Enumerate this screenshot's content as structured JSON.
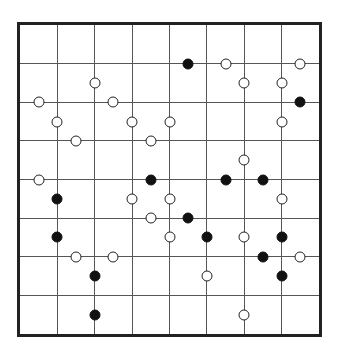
{
  "puzzle": {
    "type": "masyu-like pearl grid",
    "columns": 8,
    "rows": 8,
    "colors": {
      "border": "#222222",
      "grid_line": "#555555",
      "white_pearl": "#ffffff",
      "black_pearl": "#111111"
    },
    "pearls_note": "coordinates in half-cell units from top-left of board (cx, cy); even = on grid line, odd = cell middle",
    "pearls": [
      {
        "cx": 4,
        "cy": 3,
        "color": "white"
      },
      {
        "cx": 1,
        "cy": 4,
        "color": "white"
      },
      {
        "cx": 5,
        "cy": 4,
        "color": "white"
      },
      {
        "cx": 2,
        "cy": 5,
        "color": "white"
      },
      {
        "cx": 6,
        "cy": 5,
        "color": "white"
      },
      {
        "cx": 8,
        "cy": 5,
        "color": "white"
      },
      {
        "cx": 3,
        "cy": 6,
        "color": "white"
      },
      {
        "cx": 7,
        "cy": 6,
        "color": "white"
      },
      {
        "cx": 9,
        "cy": 2,
        "color": "black"
      },
      {
        "cx": 11,
        "cy": 2,
        "color": "white"
      },
      {
        "cx": 15,
        "cy": 2,
        "color": "white"
      },
      {
        "cx": 12,
        "cy": 3,
        "color": "white"
      },
      {
        "cx": 14,
        "cy": 3,
        "color": "white"
      },
      {
        "cx": 15,
        "cy": 4,
        "color": "black"
      },
      {
        "cx": 14,
        "cy": 5,
        "color": "white"
      },
      {
        "cx": 1,
        "cy": 8,
        "color": "white"
      },
      {
        "cx": 7,
        "cy": 8,
        "color": "black"
      },
      {
        "cx": 2,
        "cy": 9,
        "color": "black"
      },
      {
        "cx": 6,
        "cy": 9,
        "color": "white"
      },
      {
        "cx": 8,
        "cy": 9,
        "color": "white"
      },
      {
        "cx": 7,
        "cy": 10,
        "color": "white"
      },
      {
        "cx": 2,
        "cy": 11,
        "color": "black"
      },
      {
        "cx": 8,
        "cy": 11,
        "color": "white"
      },
      {
        "cx": 12,
        "cy": 7,
        "color": "white"
      },
      {
        "cx": 11,
        "cy": 8,
        "color": "black"
      },
      {
        "cx": 13,
        "cy": 8,
        "color": "black"
      },
      {
        "cx": 14,
        "cy": 9,
        "color": "white"
      },
      {
        "cx": 9,
        "cy": 10,
        "color": "black"
      },
      {
        "cx": 10,
        "cy": 11,
        "color": "black"
      },
      {
        "cx": 12,
        "cy": 11,
        "color": "white"
      },
      {
        "cx": 14,
        "cy": 11,
        "color": "black"
      },
      {
        "cx": 3,
        "cy": 12,
        "color": "white"
      },
      {
        "cx": 5,
        "cy": 12,
        "color": "white"
      },
      {
        "cx": 4,
        "cy": 13,
        "color": "black"
      },
      {
        "cx": 4,
        "cy": 15,
        "color": "black"
      },
      {
        "cx": 13,
        "cy": 12,
        "color": "black"
      },
      {
        "cx": 15,
        "cy": 12,
        "color": "white"
      },
      {
        "cx": 10,
        "cy": 13,
        "color": "white"
      },
      {
        "cx": 14,
        "cy": 13,
        "color": "black"
      },
      {
        "cx": 12,
        "cy": 15,
        "color": "white"
      }
    ]
  }
}
